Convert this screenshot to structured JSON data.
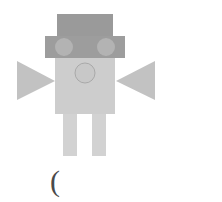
{
  "canvas": {
    "width": 222,
    "height": 202,
    "background_color": "#ffffff",
    "title": "robot figure drawing"
  },
  "figure": {
    "name": "robot",
    "parts": [
      {
        "name": "hat",
        "shape": "rectangle",
        "x": 57,
        "y": 14,
        "width": 56,
        "height": 22,
        "fill": "#9a9a9a"
      },
      {
        "name": "head",
        "shape": "rectangle",
        "x": 45,
        "y": 36,
        "width": 80,
        "height": 22,
        "fill": "#9d9d9d"
      },
      {
        "name": "left-eye",
        "shape": "circle",
        "cx": 64,
        "cy": 47,
        "r": 9,
        "fill": "#b3b3b3"
      },
      {
        "name": "right-eye",
        "shape": "circle",
        "cx": 106,
        "cy": 47,
        "r": 9,
        "fill": "#b3b3b3"
      },
      {
        "name": "torso",
        "shape": "rectangle",
        "x": 55,
        "y": 58,
        "width": 60,
        "height": 56,
        "fill": "#cdcdcd"
      },
      {
        "name": "chest-button",
        "shape": "circle",
        "cx": 85,
        "cy": 73,
        "r": 10,
        "fill": "#c8c8c8",
        "stroke": "#a9a9a9"
      },
      {
        "name": "left-arm",
        "shape": "triangle",
        "points": "17,61 17,100 55,81",
        "fill": "#c2c2c2"
      },
      {
        "name": "right-arm",
        "shape": "triangle",
        "points": "155,61 155,100 116,81",
        "fill": "#c2c2c2"
      },
      {
        "name": "left-leg",
        "shape": "rectangle",
        "x": 63,
        "y": 114,
        "width": 14,
        "height": 42,
        "fill": "#d2d2d2"
      },
      {
        "name": "right-leg",
        "shape": "rectangle",
        "x": 92,
        "y": 114,
        "width": 14,
        "height": 42,
        "fill": "#d2d2d2"
      }
    ]
  },
  "caption": {
    "text": "(",
    "color": "#4a4a4a"
  }
}
